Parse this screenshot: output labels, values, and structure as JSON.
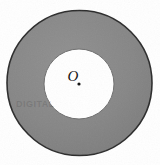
{
  "figure": {
    "kind": "annulus-diagram",
    "background_color": "#ffffff",
    "ring_fill_color": "#878787",
    "ring_stroke_color": "#2b2b2b",
    "inner_fill_color": "#ffffff",
    "inner_stroke_color": "#6f6f6f",
    "center_dot_color": "#111111",
    "outer_circle": {
      "label": "outer circle",
      "cx": 79.5,
      "cy": 83,
      "r": 72.5,
      "stroke_width": 1.6
    },
    "inner_circle": {
      "label": "inner circle",
      "cx": 79,
      "cy": 84,
      "r": 35,
      "stroke_width": 1.0
    },
    "center_point": {
      "label": "O",
      "x": 79,
      "y": 84,
      "dot_radius": 1.6,
      "label_offset_x": -6,
      "label_offset_y": -3,
      "font_size": "15px"
    },
    "scan_artifact": {
      "text": "DIGITAL",
      "x": 16,
      "y": 99,
      "font_size": "9px"
    }
  }
}
